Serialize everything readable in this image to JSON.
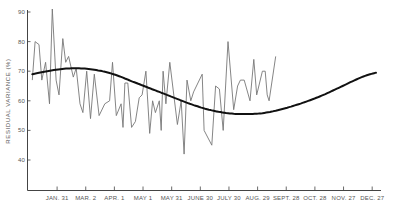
{
  "chart_data": {
    "type": "line",
    "title": "",
    "xlabel": "",
    "ylabel": "RESIDUAL VARIANCE (%)",
    "ylim": [
      30,
      90
    ],
    "yticks": [
      40,
      50,
      60,
      70,
      80,
      90
    ],
    "xticks": [
      "JAN. 31",
      "MAR. 2",
      "APR. 1",
      "MAY 1",
      "MAY 31",
      "JUNE 30",
      "JULY 30",
      "AUG. 29",
      "SEPT. 28",
      "OCT. 28",
      "NOV. 27",
      "DEC. 27"
    ],
    "grid": false,
    "legend": null,
    "series": [
      {
        "name": "Residual variance (observed)",
        "style": "thin gray line",
        "x_day_of_year": [
          5,
          8,
          12,
          15,
          19,
          23,
          26,
          30,
          33,
          37,
          40,
          43,
          48,
          51,
          55,
          58,
          62,
          66,
          70,
          75,
          81,
          86,
          89,
          93,
          98,
          100,
          102,
          105,
          109,
          113,
          117,
          120,
          124,
          128,
          131,
          134,
          138,
          140,
          142,
          145,
          149,
          157,
          161,
          164,
          167,
          171,
          174,
          183,
          185,
          193,
          197,
          201,
          205,
          210,
          216,
          220,
          223,
          227,
          233,
          237,
          240,
          246,
          249,
          251,
          253,
          260
        ],
        "values": [
          67,
          80,
          79,
          67,
          73,
          59,
          91,
          67,
          62,
          81,
          73,
          75,
          68,
          71,
          59,
          56,
          70,
          54,
          69,
          55,
          59,
          60,
          73,
          55,
          59,
          51,
          66,
          66,
          51,
          53,
          61,
          62,
          70,
          49,
          60,
          56,
          60,
          50,
          70,
          59,
          73,
          52,
          60,
          42,
          67,
          60,
          63,
          69,
          50,
          45,
          65,
          64,
          50,
          80,
          57,
          65,
          67,
          67,
          60,
          74,
          62,
          70,
          70,
          62,
          60,
          75
        ],
        "color": "#777777"
      },
      {
        "name": "Seasonal fit (smoothed)",
        "style": "thick black curve",
        "x_day_of_year": [
          5,
          30,
          50,
          70,
          90,
          110,
          130,
          150,
          170,
          190,
          210,
          230,
          250,
          270,
          290,
          310,
          330,
          350,
          365
        ],
        "values": [
          69,
          70.5,
          71,
          70.5,
          69,
          66.5,
          64,
          61.5,
          59,
          57,
          55.8,
          55.5,
          56,
          57.5,
          59.5,
          62,
          65,
          68,
          69.5
        ],
        "color": "#111111"
      }
    ]
  },
  "axes": {
    "y_label": "RESIDUAL VARIANCE (%)",
    "y_ticks": [
      "90",
      "80",
      "70",
      "60",
      "50",
      "40"
    ],
    "x_ticks": [
      "JAN. 31",
      "MAR. 2",
      "APR. 1",
      "MAY 1",
      "MAY 31",
      "JUNE 30",
      "JULY 30",
      "AUG. 29",
      "SEPT. 28",
      "OCT. 28",
      "NOV. 27",
      "DEC. 27"
    ]
  }
}
